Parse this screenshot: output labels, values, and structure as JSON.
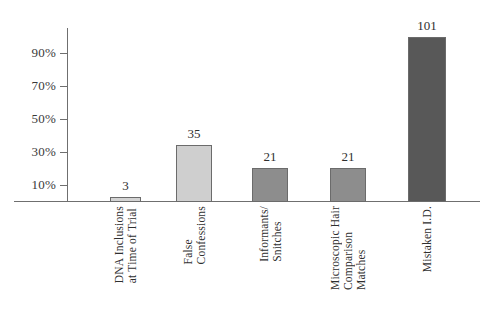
{
  "chart_data": {
    "type": "bar",
    "title": "",
    "subtitle": "",
    "xlabel": "",
    "ylabel": "",
    "categories": [
      "DNA Inclusions at Time of Trial",
      "False Confessions",
      "Informants/ Snitches",
      "Microscopic Hair Comparison Matches",
      "Mistaken I.D."
    ],
    "category_lines": [
      [
        "DNA Inclusions",
        "at Time of Trial"
      ],
      [
        "False",
        "Confessions"
      ],
      [
        "Informants/",
        "Snitches"
      ],
      [
        "Microscopic Hair",
        "Comparison",
        "Matches"
      ],
      [
        "Mistaken I.D."
      ]
    ],
    "values": [
      3,
      35,
      21,
      21,
      101
    ],
    "value_labels": [
      "3",
      "35",
      "21",
      "21",
      "101"
    ],
    "percent_of_max": [
      3.0,
      34.7,
      20.8,
      20.8,
      100.0
    ],
    "ytick_labels": [
      "10%",
      "30%",
      "50%",
      "70%",
      "90%"
    ],
    "ytick_values": [
      10,
      30,
      50,
      70,
      90
    ],
    "ylim": [
      0,
      105
    ],
    "grid": false,
    "legend": "none",
    "bar_colors": [
      "#d3d3d3",
      "#cfcfcf",
      "#8d8d8d",
      "#8d8d8d",
      "#585858"
    ],
    "bar_border_color": "#6b6b6b",
    "axis_color": "#6f6f6f",
    "text_color": "#2f2f2f",
    "background": "#ffffff"
  }
}
